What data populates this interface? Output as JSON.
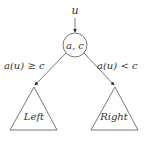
{
  "diagram": {
    "type": "decision-tree-node",
    "input_label": "u",
    "node_label": "a, c",
    "edges": [
      {
        "condition": "a(u) ≥ c",
        "target": "Left"
      },
      {
        "condition": "a(u) < c",
        "target": "Right"
      }
    ],
    "subtrees": [
      {
        "label": "Left"
      },
      {
        "label": "Right"
      }
    ],
    "colors": {
      "stroke": "#555555",
      "text": "#333333",
      "background": "#ffffff"
    }
  }
}
